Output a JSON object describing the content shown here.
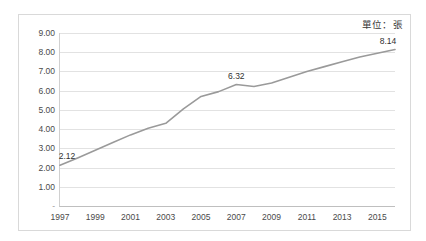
{
  "annotation": {
    "unit_note": "單位：張"
  },
  "chart_data": {
    "type": "line",
    "title": "",
    "subtitle": "",
    "xlabel": "",
    "ylabel": "",
    "unit_note": "單位：張",
    "grid": "horizontal",
    "legend": "none",
    "line_color": "#9a9a9a",
    "border_color": "#d9d9d9",
    "gridline_color": "#e2e2e2",
    "ylim": [
      0,
      9
    ],
    "ytick_values": [
      0,
      1,
      2,
      3,
      4,
      5,
      6,
      7,
      8,
      9
    ],
    "ytick_labels": [
      "-",
      "1.00",
      "2.00",
      "3.00",
      "4.00",
      "5.00",
      "6.00",
      "7.00",
      "8.00",
      "9.00"
    ],
    "xlim": [
      1997,
      2016
    ],
    "xtick_labels": [
      "1997",
      "1999",
      "2001",
      "2003",
      "2005",
      "2007",
      "2009",
      "2011",
      "2013",
      "2015"
    ],
    "xtick_values": [
      1997,
      1999,
      2001,
      2003,
      2005,
      2007,
      2009,
      2011,
      2013,
      2015
    ],
    "x": [
      1997,
      1998,
      1999,
      2000,
      2001,
      2002,
      2003,
      2004,
      2005,
      2006,
      2007,
      2008,
      2009,
      2010,
      2011,
      2012,
      2013,
      2014,
      2015,
      2016
    ],
    "values": [
      2.12,
      2.5,
      2.9,
      3.3,
      3.7,
      4.05,
      4.3,
      5.05,
      5.7,
      5.95,
      6.32,
      6.22,
      6.4,
      6.7,
      7.0,
      7.25,
      7.5,
      7.75,
      7.95,
      8.14
    ],
    "point_labels": [
      {
        "x": 1997,
        "y": 2.12,
        "text": "2.12"
      },
      {
        "x": 2007,
        "y": 6.32,
        "text": "6.32"
      },
      {
        "x": 2016,
        "y": 8.14,
        "text": "8.14"
      }
    ]
  }
}
